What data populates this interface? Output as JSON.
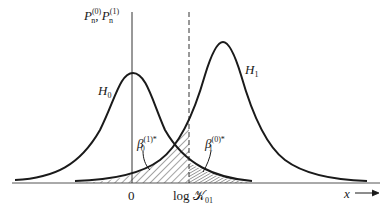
{
  "figure": {
    "y_axis_label": {
      "base": "P",
      "sub": "n",
      "sup0": "(0)",
      "sup1": "(1)",
      "sep": ", "
    },
    "curves": [
      {
        "name": "H0",
        "base": "H",
        "sub": "0",
        "peak_x": 0
      },
      {
        "name": "H1",
        "base": "H",
        "sub": "1"
      }
    ],
    "regions": [
      {
        "name": "beta0_1_star",
        "base": "β",
        "sub": "0",
        "sup": "(1)*"
      },
      {
        "name": "beta1_0_star",
        "base": "β",
        "sub": "1",
        "sup": "(0)*"
      }
    ],
    "x_ticks": {
      "zero": "0",
      "threshold": {
        "prefix": "log ",
        "symbol": "𝒦",
        "sub": "01"
      }
    },
    "x_axis_label": "x",
    "x_axis_arrow": "⟶"
  },
  "colors": {
    "ink": "#1a1a1a",
    "background": "#ffffff"
  }
}
